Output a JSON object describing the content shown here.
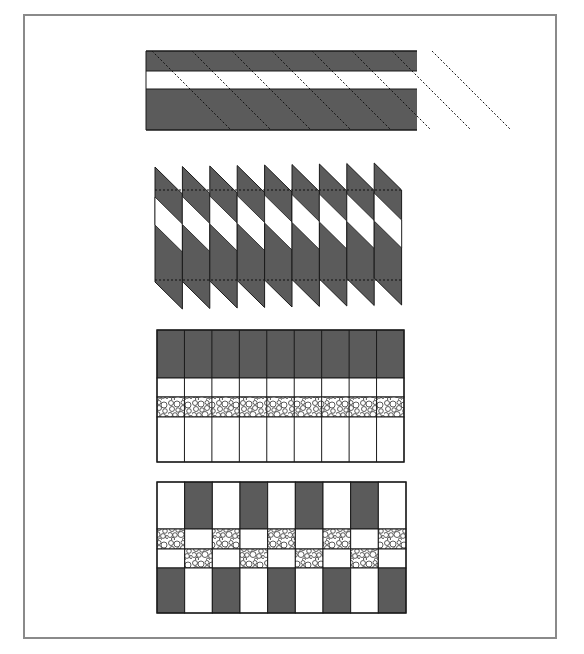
{
  "figure": {
    "colors": {
      "dark_fabric": "#5b5b5b",
      "light_fabric": "#ffffff",
      "outline": "#1a1a1a",
      "frame": "#8a8a8a",
      "pebble_bg": "#ffffff",
      "pebble_stroke": "#333333"
    },
    "panels": [
      {
        "id": "strip-set",
        "label": "Strip set with diagonal cutting lines",
        "bands": [
          "dark",
          "light",
          "dark"
        ],
        "diagonal_cuts": 8
      },
      {
        "id": "cut-segments",
        "label": "Diagonal segments cut from strip set",
        "segments": 9,
        "bands": [
          "dark",
          "light",
          "dark"
        ]
      },
      {
        "id": "column-strip",
        "label": "Rectangular columns with pebble print band",
        "columns": 9,
        "rows": [
          "dark",
          "light",
          "pebble",
          "light"
        ]
      },
      {
        "id": "checkerboard",
        "label": "Alternating columns forming checkerboard",
        "columns": 9,
        "rows": [
          [
            "light",
            "dark",
            "light",
            "dark",
            "light",
            "dark",
            "light",
            "dark",
            "light"
          ],
          [
            "pebble",
            "light",
            "pebble",
            "light",
            "pebble",
            "light",
            "pebble",
            "light",
            "pebble"
          ],
          [
            "light",
            "pebble",
            "light",
            "pebble",
            "light",
            "pebble",
            "light",
            "pebble",
            "light"
          ],
          [
            "dark",
            "light",
            "dark",
            "light",
            "dark",
            "light",
            "dark",
            "light",
            "dark"
          ]
        ]
      }
    ]
  }
}
